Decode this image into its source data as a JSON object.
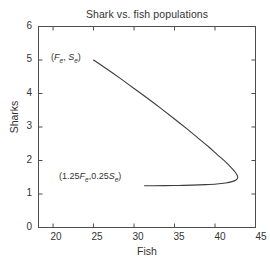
{
  "chart_data": {
    "type": "line",
    "title": "Shark vs. fish populations",
    "xlabel": "Fish",
    "ylabel": "Sharks",
    "xlim": [
      18.2,
      45
    ],
    "ylim": [
      0,
      6
    ],
    "xticks": [
      20,
      25,
      30,
      35,
      40,
      45
    ],
    "yticks": [
      0,
      1,
      2,
      3,
      4,
      5,
      6
    ],
    "grid": false,
    "legend": null,
    "series": [
      {
        "name": "phase trajectory",
        "x": [
          25.0,
          26.6,
          28.3,
          30.0,
          31.7,
          33.4,
          35.0,
          36.5,
          37.9,
          39.2,
          40.3,
          41.3,
          42.0,
          42.5,
          42.75,
          42.8,
          42.6,
          42.1,
          41.3,
          40.2,
          38.8,
          37.2,
          35.5,
          33.8,
          32.4,
          31.3
        ],
        "y": [
          5.0,
          4.74,
          4.45,
          4.15,
          3.85,
          3.54,
          3.24,
          2.95,
          2.67,
          2.41,
          2.17,
          1.96,
          1.79,
          1.65,
          1.55,
          1.48,
          1.42,
          1.37,
          1.33,
          1.3,
          1.28,
          1.265,
          1.255,
          1.25,
          1.248,
          1.247
        ]
      }
    ],
    "annotations": [
      {
        "id": "equilibrium-point-label",
        "parts": [
          {
            "t": "(",
            "style": "plain"
          },
          {
            "t": "F",
            "style": "italic"
          },
          {
            "t": "e",
            "style": "sub"
          },
          {
            "t": ", ",
            "style": "plain"
          },
          {
            "t": "S",
            "style": "italic"
          },
          {
            "t": "e",
            "style": "sub"
          },
          {
            "t": ")",
            "style": "plain"
          }
        ],
        "text": "(Fe, Se)",
        "data_x": 25.0,
        "data_y": 5.0
      },
      {
        "id": "perturbed-point-label",
        "parts": [
          {
            "t": "(1.25",
            "style": "plain"
          },
          {
            "t": "F",
            "style": "italic"
          },
          {
            "t": "e",
            "style": "sub"
          },
          {
            "t": ",0.25",
            "style": "plain"
          },
          {
            "t": "S",
            "style": "italic"
          },
          {
            "t": "e",
            "style": "sub"
          },
          {
            "t": ")",
            "style": "plain"
          }
        ],
        "text": "(1.25Fe,0.25Se)",
        "data_x": 31.3,
        "data_y": 1.25
      }
    ]
  },
  "figure": {
    "title": "Shark vs. fish populations",
    "xlabel": "Fish",
    "ylabel": "Sharks",
    "ytick_labels": [
      "6",
      "5",
      "4",
      "3",
      "2",
      "1",
      "0"
    ],
    "xtick_labels": [
      "20",
      "25",
      "30",
      "35",
      "40",
      "45"
    ],
    "line_color": "#3c3c3c",
    "axis_color": "#4d4d4d",
    "background_color": "#ffffff",
    "text_color": "#333333"
  }
}
